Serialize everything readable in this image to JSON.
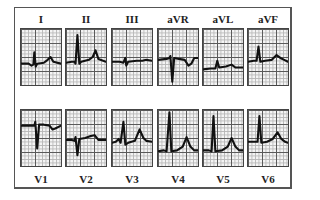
{
  "figure": {
    "limb_leads": [
      {
        "label": "I"
      },
      {
        "label": "II"
      },
      {
        "label": "III"
      },
      {
        "label": "aVR"
      },
      {
        "label": "aVL"
      },
      {
        "label": "aVF"
      }
    ],
    "precordial_leads": [
      {
        "label": "V1"
      },
      {
        "label": "V2"
      },
      {
        "label": "V3"
      },
      {
        "label": "V4"
      },
      {
        "label": "V5"
      },
      {
        "label": "V6"
      }
    ]
  },
  "colors": {
    "grid_major": "#5a5a5a",
    "grid_minor": "#b8b8b8",
    "trace": "#111111",
    "paper": "#f4f4f4"
  }
}
